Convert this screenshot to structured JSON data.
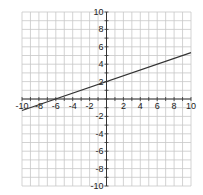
{
  "chart_data": {
    "type": "line",
    "title": "",
    "xlabel": "",
    "ylabel": "",
    "xlim": [
      -10,
      10
    ],
    "ylim": [
      -10,
      10
    ],
    "grid": true,
    "grid_minor_step": 1,
    "x_tick_labels": [
      "-10",
      "-8",
      "-6",
      "-4",
      "-2",
      "2",
      "4",
      "6",
      "8",
      "10"
    ],
    "y_tick_labels": [
      "10",
      "8",
      "6",
      "4",
      "2",
      "-2",
      "-4",
      "-6",
      "-8",
      "-10"
    ],
    "series": [
      {
        "name": "y = (1/3)x + 2",
        "slope": 0.3333,
        "intercept": 2,
        "x": [
          -10,
          -6,
          0,
          10
        ],
        "y": [
          -1.33,
          0,
          2,
          5.33
        ],
        "color": "#333333"
      }
    ]
  },
  "colors": {
    "grid": "#c8c8c8",
    "axis": "#333333",
    "line": "#333333",
    "background": "#ffffff"
  }
}
